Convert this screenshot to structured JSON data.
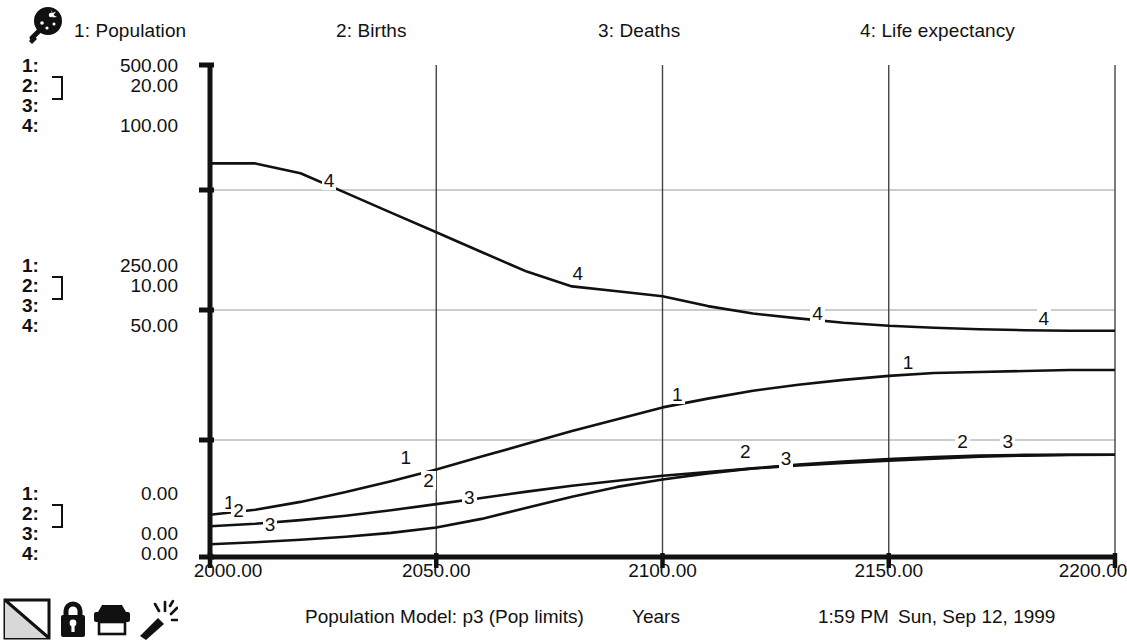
{
  "legend": {
    "items": [
      {
        "label": "1: Population",
        "index": "1",
        "name": "Population"
      },
      {
        "label": "2: Births",
        "index": "2",
        "name": "Births"
      },
      {
        "label": "3: Deaths",
        "index": "3",
        "name": "Deaths"
      },
      {
        "label": "4: Life expectancy",
        "index": "4",
        "name": "Life expectancy"
      }
    ],
    "magnifier_icon": "magnifier-icon"
  },
  "y_axis": {
    "top": {
      "rows": [
        {
          "idx": "1:",
          "value": "500.00"
        },
        {
          "idx": "2:",
          "value": "20.00"
        },
        {
          "idx": "3:",
          "value": ""
        },
        {
          "idx": "4:",
          "value": "100.00"
        }
      ]
    },
    "middle": {
      "rows": [
        {
          "idx": "1:",
          "value": "250.00"
        },
        {
          "idx": "2:",
          "value": "10.00"
        },
        {
          "idx": "3:",
          "value": ""
        },
        {
          "idx": "4:",
          "value": "50.00"
        }
      ]
    },
    "bottom": {
      "rows": [
        {
          "idx": "1:",
          "value": "0.00"
        },
        {
          "idx": "2:",
          "value": ""
        },
        {
          "idx": "3:",
          "value": "0.00"
        },
        {
          "idx": "4:",
          "value": "0.00"
        }
      ]
    }
  },
  "x_axis": {
    "ticks": [
      "2000.00",
      "2050.00",
      "2100.00",
      "2150.00",
      "2200.00"
    ]
  },
  "status": {
    "model": "Population Model: p3 (Pop limits)",
    "units": "Years",
    "time": "1:59 PM",
    "date": "Sun, Sep 12, 1999",
    "icons": [
      "graph-page-icon",
      "lock-icon",
      "printer-icon",
      "magic-wand-icon"
    ]
  },
  "chart_data": {
    "type": "line",
    "title": "Population Model: p3 (Pop limits)",
    "xlabel": "Years",
    "ylabel": "",
    "grid": true,
    "legend_position": "top",
    "xlim": [
      2000,
      2200
    ],
    "xticks": [
      2000,
      2050,
      2100,
      2150,
      2200
    ],
    "axes": [
      {
        "series": "Population",
        "index": 1,
        "min": 0,
        "mid": 250,
        "max": 500
      },
      {
        "series": "Births",
        "index": 2,
        "min": 0,
        "mid": 10,
        "max": 20
      },
      {
        "series": "Deaths",
        "index": 3,
        "min": 0,
        "mid": 10,
        "max": 20
      },
      {
        "series": "Life expectancy",
        "index": 4,
        "min": 0,
        "mid": 50,
        "max": 100
      }
    ],
    "x": [
      2000,
      2010,
      2020,
      2030,
      2040,
      2050,
      2060,
      2070,
      2080,
      2090,
      2100,
      2110,
      2120,
      2130,
      2140,
      2150,
      2160,
      2170,
      2180,
      2190,
      2200
    ],
    "series": [
      {
        "name": "Population",
        "index": 1,
        "axis_max": 500,
        "label_points": [
          {
            "x": 2004,
            "y": 43
          },
          {
            "x": 2043,
            "y": 88
          },
          {
            "x": 2103,
            "y": 152
          },
          {
            "x": 2154,
            "y": 185
          }
        ],
        "values": [
          43,
          48,
          56,
          66,
          77,
          89,
          102,
          115,
          128,
          140,
          152,
          161,
          169,
          175,
          180,
          184,
          187,
          188,
          189,
          190,
          190
        ]
      },
      {
        "name": "Births",
        "index": 2,
        "axis_max": 20,
        "label_points": [
          {
            "x": 2006,
            "y": 1.4
          },
          {
            "x": 2048,
            "y": 2.6
          },
          {
            "x": 2118,
            "y": 3.8
          },
          {
            "x": 2166,
            "y": 4.2
          }
        ],
        "values": [
          1.25,
          1.35,
          1.5,
          1.68,
          1.9,
          2.15,
          2.4,
          2.66,
          2.9,
          3.1,
          3.3,
          3.45,
          3.6,
          3.72,
          3.82,
          3.92,
          4.0,
          4.08,
          4.12,
          4.15,
          4.16
        ]
      },
      {
        "name": "Deaths",
        "index": 3,
        "axis_max": 20,
        "label_points": [
          {
            "x": 2013,
            "y": 0.8
          },
          {
            "x": 2057,
            "y": 1.9
          },
          {
            "x": 2127,
            "y": 3.5
          },
          {
            "x": 2176,
            "y": 4.2
          }
        ],
        "values": [
          0.52,
          0.6,
          0.7,
          0.82,
          0.98,
          1.2,
          1.55,
          2.0,
          2.45,
          2.85,
          3.15,
          3.4,
          3.6,
          3.76,
          3.88,
          3.98,
          4.06,
          4.12,
          4.15,
          4.16,
          4.16
        ]
      },
      {
        "name": "Life expectancy",
        "index": 4,
        "axis_max": 100,
        "label_points": [
          {
            "x": 2026,
            "y": 74
          },
          {
            "x": 2081,
            "y": 55
          },
          {
            "x": 2134,
            "y": 47
          },
          {
            "x": 2184,
            "y": 46
          }
        ],
        "values": [
          80,
          80,
          78,
          74,
          70,
          66,
          62,
          58,
          55,
          54,
          53,
          51,
          49.5,
          48.5,
          47.6,
          47,
          46.6,
          46.3,
          46.1,
          46,
          46
        ]
      }
    ]
  }
}
